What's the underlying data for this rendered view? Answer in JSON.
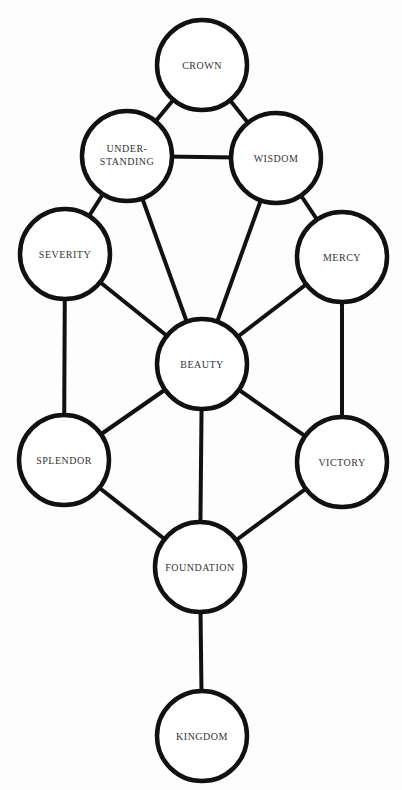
{
  "diagram": {
    "nodes": [
      {
        "id": "crown",
        "label": "CROWN",
        "cx": 202,
        "cy": 65
      },
      {
        "id": "understanding",
        "label": "UNDER-",
        "label2": "STANDING",
        "cx": 127,
        "cy": 156
      },
      {
        "id": "wisdom",
        "label": "WISDOM",
        "cx": 276,
        "cy": 158
      },
      {
        "id": "severity",
        "label": "SEVERITY",
        "cx": 65,
        "cy": 254
      },
      {
        "id": "mercy",
        "label": "MERCY",
        "cx": 342,
        "cy": 257
      },
      {
        "id": "beauty",
        "label": "BEAUTY",
        "cx": 202,
        "cy": 364
      },
      {
        "id": "splendor",
        "label": "SPLENDOR",
        "cx": 64,
        "cy": 460
      },
      {
        "id": "victory",
        "label": "VICTORY",
        "cx": 342,
        "cy": 462
      },
      {
        "id": "foundation",
        "label": "FOUNDATION",
        "cx": 200,
        "cy": 567
      },
      {
        "id": "kingdom",
        "label": "KINGDOM",
        "cx": 202,
        "cy": 736
      }
    ],
    "edges": [
      [
        "crown",
        "understanding"
      ],
      [
        "crown",
        "wisdom"
      ],
      [
        "understanding",
        "wisdom"
      ],
      [
        "understanding",
        "severity"
      ],
      [
        "wisdom",
        "mercy"
      ],
      [
        "understanding",
        "beauty"
      ],
      [
        "wisdom",
        "beauty"
      ],
      [
        "severity",
        "beauty"
      ],
      [
        "mercy",
        "beauty"
      ],
      [
        "severity",
        "splendor"
      ],
      [
        "mercy",
        "victory"
      ],
      [
        "beauty",
        "splendor"
      ],
      [
        "beauty",
        "victory"
      ],
      [
        "beauty",
        "foundation"
      ],
      [
        "splendor",
        "foundation"
      ],
      [
        "victory",
        "foundation"
      ],
      [
        "foundation",
        "kingdom"
      ]
    ],
    "radius": 45
  }
}
